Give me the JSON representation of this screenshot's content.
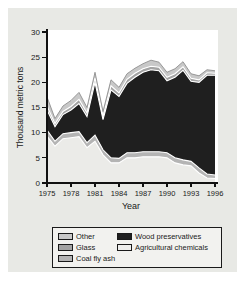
{
  "chart_data": {
    "type": "area",
    "stacked": true,
    "title": "",
    "xlabel": "Year",
    "ylabel": "Thousand metric tons",
    "xlim": [
      1975,
      1996
    ],
    "ylim": [
      0,
      30
    ],
    "x_ticks": [
      1975,
      1978,
      1981,
      1984,
      1987,
      1990,
      1993,
      1996
    ],
    "y_ticks": [
      0,
      5,
      10,
      15,
      20,
      25,
      30
    ],
    "grid": false,
    "x": [
      1975,
      1976,
      1977,
      1978,
      1979,
      1980,
      1981,
      1982,
      1983,
      1984,
      1985,
      1986,
      1987,
      1988,
      1989,
      1990,
      1991,
      1992,
      1993,
      1994,
      1995,
      1996
    ],
    "stack_order_bottom_to_top": [
      "Agricultural chemicals",
      "Coal fly ash",
      "Wood preservatives",
      "Glass",
      "Other"
    ],
    "series": [
      {
        "name": "Agricultural chemicals",
        "color": "#ebebe8",
        "values": [
          9.3,
          7.3,
          8.8,
          9.0,
          9.2,
          7.0,
          8.3,
          5.6,
          4.0,
          4.0,
          5.0,
          5.0,
          5.2,
          5.2,
          5.2,
          5.0,
          4.0,
          3.6,
          3.4,
          2.0,
          1.0,
          0.9
        ]
      },
      {
        "name": "Coal fly ash",
        "color": "#b4b4b4",
        "values": [
          1.2,
          1.0,
          1.0,
          1.0,
          1.0,
          1.0,
          1.2,
          1.0,
          1.0,
          0.9,
          1.0,
          1.0,
          1.0,
          1.0,
          1.0,
          1.0,
          1.0,
          1.0,
          0.9,
          1.0,
          0.8,
          0.7
        ]
      },
      {
        "name": "Wood preservatives",
        "color": "#1f1f1f",
        "values": [
          4.0,
          2.9,
          3.8,
          4.5,
          5.6,
          5.2,
          10.5,
          6.0,
          13.5,
          12.3,
          13.8,
          15.0,
          15.8,
          16.3,
          16.1,
          14.3,
          16.0,
          17.8,
          15.9,
          17.0,
          19.6,
          19.8
        ]
      },
      {
        "name": "Glass",
        "color": "#a3a3a3",
        "values": [
          0.8,
          0.6,
          0.6,
          0.7,
          0.8,
          0.7,
          0.9,
          0.6,
          0.8,
          0.7,
          0.8,
          0.8,
          0.7,
          0.7,
          0.7,
          0.7,
          0.7,
          0.7,
          0.6,
          0.5,
          0.5,
          0.4
        ]
      },
      {
        "name": "Other",
        "color": "#c8c8c8",
        "values": [
          1.8,
          1.0,
          1.1,
          1.2,
          1.4,
          1.1,
          1.1,
          1.0,
          1.2,
          1.1,
          1.1,
          1.0,
          1.0,
          1.2,
          1.0,
          1.0,
          1.0,
          1.0,
          0.9,
          0.8,
          0.6,
          0.5
        ]
      }
    ],
    "legend": {
      "position": "bottom",
      "entries": [
        {
          "label": "Other",
          "color": "#c8c8c8",
          "column": 1,
          "row": 1
        },
        {
          "label": "Wood preservatives",
          "color": "#1f1f1f",
          "column": 2,
          "row": 1
        },
        {
          "label": "Glass",
          "color": "#a3a3a3",
          "column": 1,
          "row": 2
        },
        {
          "label": "Agricultural chemicals",
          "color": "#eeeeec",
          "column": 2,
          "row": 2
        },
        {
          "label": "Coal fly ash",
          "color": "#b4b4b4",
          "column": 1,
          "row": 3
        }
      ]
    }
  }
}
